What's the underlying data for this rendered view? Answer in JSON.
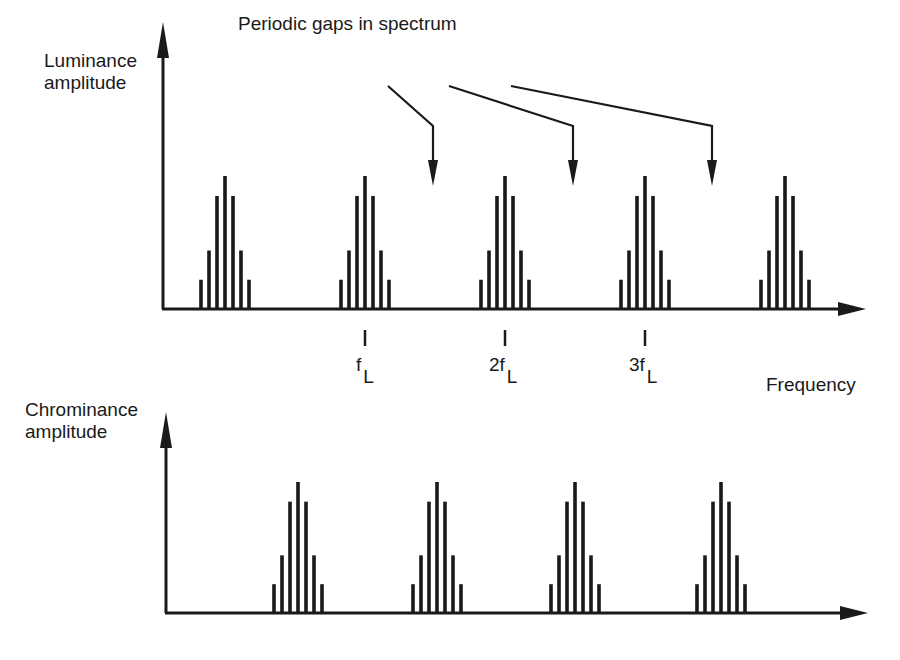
{
  "title": "Periodic gaps in spectrum",
  "top_panel": {
    "ylabel_line1": "Luminance",
    "ylabel_line2": "amplitude",
    "xlabel": "Frequency",
    "ticks": [
      {
        "prefix": "f",
        "sub": "L"
      },
      {
        "prefix": "2f",
        "sub": "L"
      },
      {
        "prefix": "3f",
        "sub": "L"
      }
    ]
  },
  "bottom_panel": {
    "ylabel_line1": "Chrominance",
    "ylabel_line2": "amplitude"
  },
  "colors": {
    "ink": "#1a1a1a",
    "background": "#ffffff"
  },
  "chart_data": [
    {
      "type": "bar",
      "title": "Periodic gaps in spectrum",
      "ylabel": "Luminance amplitude",
      "xlabel": "Frequency",
      "tick_labels": [
        "fL",
        "2fL",
        "3fL"
      ],
      "cluster_centers_px": [
        225,
        365,
        505,
        645,
        785
      ],
      "cluster_bar_offsets_px": [
        -24,
        -16,
        -8,
        0,
        8,
        16,
        24
      ],
      "cluster_bar_heights_rel": [
        0.22,
        0.44,
        0.85,
        1.0,
        0.85,
        0.44,
        0.22
      ],
      "annotations": [
        "Periodic gaps in spectrum → arrows to gaps between fL and 2fL, 2fL and 3fL, 3fL and next"
      ]
    },
    {
      "type": "bar",
      "ylabel": "Chrominance amplitude",
      "cluster_centers_px": [
        298,
        437,
        575,
        721
      ],
      "cluster_bar_offsets_px": [
        -24,
        -16,
        -8,
        0,
        8,
        16,
        24
      ],
      "cluster_bar_heights_rel": [
        0.22,
        0.44,
        0.85,
        1.0,
        0.85,
        0.44,
        0.22
      ],
      "note": "Chrominance clusters interleave into the luminance spectrum gaps"
    }
  ]
}
